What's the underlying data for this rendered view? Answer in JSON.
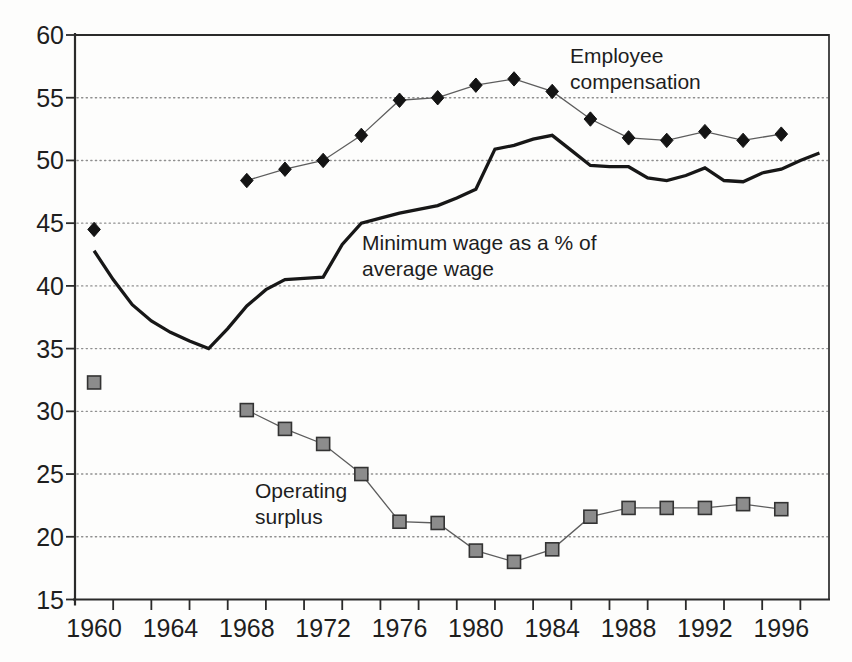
{
  "chart_data": {
    "type": "line",
    "title": "",
    "xlabel": "",
    "ylabel": "",
    "background": "#fdfdfc",
    "axis_color": "#2a2a2a",
    "text_color": "#1e1e1e",
    "grid": {
      "style": "dotted",
      "color": "#8f8f8f",
      "values": [
        20,
        25,
        30,
        35,
        40,
        45,
        50,
        55
      ]
    },
    "x_axis": {
      "domain": [
        1959,
        1998.5
      ],
      "tick_years": [
        1961,
        1963,
        1965,
        1967,
        1969,
        1971,
        1973,
        1975,
        1977,
        1979,
        1981,
        1983,
        1985,
        1987,
        1989,
        1991,
        1993,
        1995,
        1997
      ],
      "label_years": [
        1960,
        1964,
        1968,
        1972,
        1976,
        1980,
        1984,
        1988,
        1992,
        1996
      ]
    },
    "y_axis": {
      "domain": [
        15,
        60
      ],
      "ticks": [
        15,
        20,
        25,
        30,
        35,
        40,
        45,
        50,
        55,
        60
      ]
    },
    "series": [
      {
        "id": "employee-compensation",
        "name": "Employee compensation",
        "style": "line+marker",
        "marker": "diamond",
        "marker_color": "#141414",
        "marker_edge": "#141414",
        "line_color": "#5d5d5d",
        "line_width": 1.3,
        "gap_after_index": 0,
        "x": [
          1960,
          1968,
          1970,
          1972,
          1974,
          1976,
          1978,
          1980,
          1982,
          1984,
          1986,
          1988,
          1990,
          1992,
          1994,
          1996
        ],
        "y": [
          44.5,
          48.4,
          49.3,
          50.0,
          52.0,
          54.8,
          55.0,
          56.0,
          56.5,
          55.5,
          53.3,
          51.8,
          51.6,
          52.3,
          51.6,
          52.1
        ],
        "annotation": {
          "lines": [
            "Employee",
            "compensation"
          ],
          "x": 570,
          "y": 63
        }
      },
      {
        "id": "minimum-wage",
        "name": "Minimum wage as a % of average wage",
        "style": "line",
        "line_color": "#171717",
        "line_width": 3.3,
        "x": [
          1960,
          1961,
          1962,
          1963,
          1964,
          1965,
          1966,
          1967,
          1968,
          1969,
          1970,
          1971,
          1972,
          1973,
          1974,
          1975,
          1976,
          1977,
          1978,
          1979,
          1980,
          1981,
          1982,
          1983,
          1984,
          1985,
          1986,
          1987,
          1988,
          1989,
          1990,
          1991,
          1992,
          1993,
          1994,
          1995,
          1996,
          1997,
          1998
        ],
        "y": [
          42.8,
          40.5,
          38.5,
          37.2,
          36.3,
          35.6,
          35.0,
          36.6,
          38.4,
          39.7,
          40.5,
          40.6,
          40.7,
          43.3,
          45.0,
          45.4,
          45.8,
          46.1,
          46.4,
          47.0,
          47.7,
          50.9,
          51.2,
          51.7,
          52.0,
          50.8,
          49.6,
          49.5,
          49.5,
          48.6,
          48.4,
          48.8,
          49.4,
          48.4,
          48.3,
          49.0,
          49.3,
          50.0,
          50.6
        ],
        "annotation": {
          "lines": [
            "Minimum wage as a % of",
            "average wage"
          ],
          "x": 362,
          "y": 250
        }
      },
      {
        "id": "operating-surplus",
        "name": "Operating surplus",
        "style": "line+marker",
        "marker": "square",
        "marker_color": "#8c8c8c",
        "marker_edge": "#333333",
        "line_color": "#5d5d5d",
        "line_width": 1.3,
        "gap_after_index": 0,
        "x": [
          1960,
          1968,
          1970,
          1972,
          1974,
          1976,
          1978,
          1980,
          1982,
          1984,
          1986,
          1988,
          1990,
          1992,
          1994,
          1996
        ],
        "y": [
          32.3,
          30.1,
          28.6,
          27.4,
          25.0,
          21.2,
          21.1,
          18.9,
          18.0,
          19.0,
          21.6,
          22.3,
          22.3,
          22.3,
          22.6,
          22.2
        ],
        "annotation": {
          "lines": [
            "Operating",
            "surplus"
          ],
          "x": 255,
          "y": 498
        }
      }
    ]
  }
}
